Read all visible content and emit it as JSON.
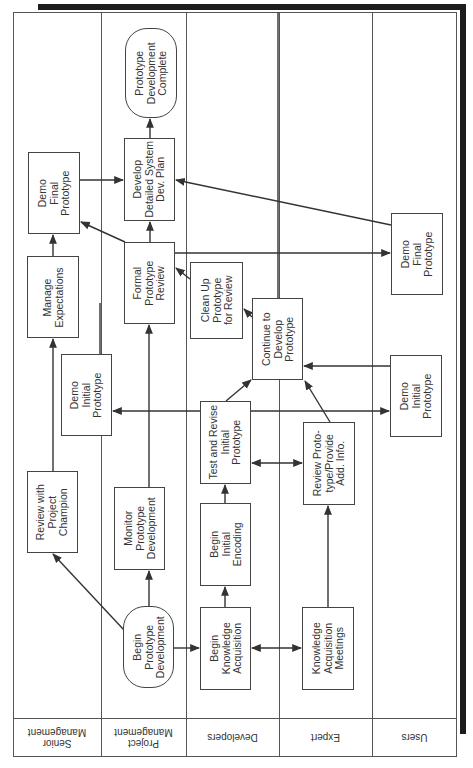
{
  "lanes": [
    {
      "id": "senior",
      "label": "Senior\nManagement"
    },
    {
      "id": "project",
      "label": "Project\nManagement"
    },
    {
      "id": "developers",
      "label": "Developers"
    },
    {
      "id": "expert",
      "label": "Expert"
    },
    {
      "id": "users",
      "label": "Users"
    }
  ],
  "nodes": {
    "proto_complete": "Prototype\nDevelopment\nComplete",
    "dev_plan": "Develop\nDetailed System\nDev. Plan",
    "demo_final_sm": "Demo\nFinal\nPrototype",
    "formal_review": "Formal\nPrototype\nReview",
    "manage_expect": "Manage\nExpectations",
    "clean_up": "Clean Up\nPrototype\nfor Review",
    "continue_dev": "Continue to\nDevelop\nPrototype",
    "demo_initial_sm": "Demo\nInitial\nPrototype",
    "demo_final_users": "Demo\nFinal\nPrototype",
    "demo_initial_users": "Demo\nInitial\nPrototype",
    "test_revise": "Test and Revise\nInitial\nPrototype",
    "review_proto": "Review Proto-\ntype/Provide\nAdd. Info.",
    "review_champion": "Review with\nProject\nChampion",
    "monitor_dev": "Monitor\nPrototype\nDevelopment",
    "begin_encoding": "Begin\nInitial\nEncoding",
    "begin_proto": "Begin\nPrototype\nDevelopment",
    "begin_ka": "Begin\nKnowledge\nAcquisition",
    "ka_meetings": "Knowledge\nAcquisition\nMeetings"
  },
  "colors": {
    "line": "#444444",
    "shadow": "#1c1c1c",
    "background": "#ffffff"
  }
}
